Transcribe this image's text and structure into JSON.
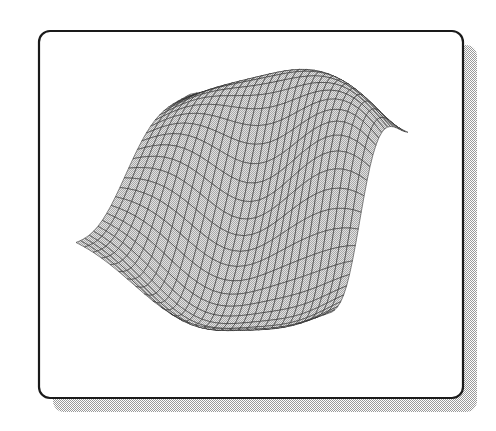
{
  "document": {
    "title": "3D Surface Mesh Plot",
    "background_color": "#ffffff",
    "width": 496,
    "height": 431
  },
  "frame": {
    "name": "figure-frame",
    "shape": "rounded-rectangle",
    "x": 39,
    "y": 31,
    "width": 424,
    "height": 367,
    "corner_radius": 11,
    "border_color": "#1a1a1a",
    "border_width": 2.2,
    "fill_color": "#ffffff",
    "shadow": {
      "offset_x": 14,
      "offset_y": 14,
      "color": "#bbbbbb",
      "pattern": "dither-halftone"
    }
  },
  "chart_data": {
    "type": "surface",
    "title": "",
    "subtitle": "",
    "xlabel": "",
    "ylabel": "",
    "zlabel": "",
    "legend": [],
    "annotations": [],
    "grid": true,
    "axes_visible": false,
    "tick_labels": [],
    "render_style": "wireframe-mesh-filled",
    "mesh_line_color": "#2a2a2a",
    "mesh_line_width": 0.55,
    "surface_fill_color": "#c9c9c9",
    "surface_fill_pattern": "dither-halftone-gray",
    "grid_columns": 30,
    "grid_rows": 26,
    "function": "peaks-like damped sinusoidal surface",
    "projection": {
      "type": "oblique-parallel",
      "azimuth_deg": -37,
      "elevation_deg": 28
    },
    "domain": {
      "u_min": 0,
      "u_max": 1,
      "v_min": 0,
      "v_max": 1
    },
    "zlim": [
      -1,
      1
    ],
    "screen_extent": {
      "x_min": 70,
      "x_max": 433,
      "y_min": 88,
      "y_max": 332
    },
    "surface_features": [
      {
        "name": "left-ridge",
        "screen_x": 150,
        "screen_y": 180,
        "height": 0.35
      },
      {
        "name": "central-saddle",
        "screen_x": 250,
        "screen_y": 165,
        "height": -0.15
      },
      {
        "name": "main-peak",
        "screen_x": 300,
        "screen_y": 105,
        "height": 0.95
      },
      {
        "name": "right-peak",
        "screen_x": 385,
        "screen_y": 140,
        "height": 0.7
      },
      {
        "name": "right-tip-sliver",
        "screen_x": 433,
        "screen_y": 172,
        "height": 0.1
      },
      {
        "name": "front-valley",
        "screen_x": 230,
        "screen_y": 300,
        "height": -0.8
      },
      {
        "name": "front-right-valley",
        "screen_x": 330,
        "screen_y": 300,
        "height": -0.6
      }
    ]
  },
  "accessibility": {
    "description": "A three-dimensional wireframe mesh surface plot shown inside a rounded rectangular frame with a dithered gray drop shadow. The surface is a smooth wavy sheet with a tall ridge rising at the back, a saddle dipping through the middle, and two V-shaped valleys along the front edge."
  }
}
